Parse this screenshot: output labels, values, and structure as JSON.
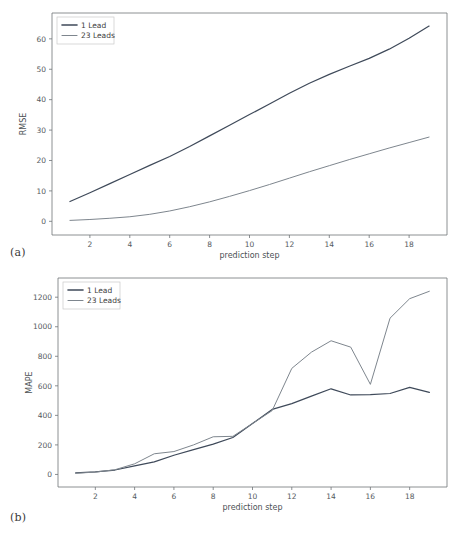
{
  "figure": {
    "panels": [
      {
        "id": "a",
        "caption": "(a)"
      },
      {
        "id": "b",
        "caption": "(b)"
      }
    ]
  },
  "colors": {
    "series_1_lead": "#3f4a5a",
    "series_23_leads": "#7e868e",
    "axis": "#6f7377",
    "text": "#4a4a4a",
    "background": "#ffffff",
    "legend_border": "#c9c9c9"
  },
  "chart_data": [
    {
      "type": "line",
      "panel": "a",
      "title": "",
      "xlabel": "prediction step",
      "ylabel": "RMSE",
      "xlim": [
        0.1,
        19.9
      ],
      "ylim": [
        -4.5,
        68.5
      ],
      "xticks": [
        2,
        4,
        6,
        8,
        10,
        12,
        14,
        16,
        18
      ],
      "yticks": [
        0,
        10,
        20,
        30,
        40,
        50,
        60
      ],
      "grid": false,
      "legend_position": "upper left",
      "x": [
        1,
        2,
        3,
        4,
        5,
        6,
        7,
        8,
        9,
        10,
        11,
        12,
        13,
        14,
        15,
        16,
        17,
        18,
        19
      ],
      "series": [
        {
          "name": "1 Lead",
          "color": "#3f4a5a",
          "values": [
            6.5,
            9.4,
            12.4,
            15.4,
            18.4,
            21.3,
            24.6,
            28.1,
            31.6,
            35.1,
            38.6,
            42.1,
            45.4,
            48.3,
            51.0,
            53.6,
            56.6,
            60.2,
            64.2
          ]
        },
        {
          "name": "23 Leads",
          "color": "#7e868e",
          "values": [
            0.3,
            0.6,
            1.0,
            1.5,
            2.3,
            3.4,
            4.8,
            6.4,
            8.2,
            10.1,
            12.1,
            14.2,
            16.3,
            18.3,
            20.3,
            22.2,
            24.1,
            25.9,
            27.7
          ]
        }
      ]
    },
    {
      "type": "line",
      "panel": "b",
      "title": "",
      "xlabel": "prediction step",
      "ylabel": "MAPE",
      "xlim": [
        0.1,
        19.9
      ],
      "ylim": [
        -85,
        1330
      ],
      "xticks": [
        2,
        4,
        6,
        8,
        10,
        12,
        14,
        16,
        18
      ],
      "yticks": [
        0,
        200,
        400,
        600,
        800,
        1000,
        1200
      ],
      "grid": false,
      "legend_position": "upper left",
      "x": [
        1,
        2,
        3,
        4,
        5,
        6,
        7,
        8,
        9,
        10,
        11,
        12,
        13,
        14,
        15,
        16,
        17,
        18,
        19
      ],
      "series": [
        {
          "name": "1 Lead",
          "color": "#3f4a5a",
          "values": [
            10,
            18,
            30,
            58,
            85,
            130,
            168,
            205,
            250,
            345,
            440,
            480,
            530,
            580,
            538,
            540,
            548,
            590,
            555
          ]
        },
        {
          "name": "23 Leads",
          "color": "#7e868e",
          "values": [
            8,
            16,
            32,
            72,
            140,
            155,
            200,
            255,
            258,
            345,
            432,
            718,
            828,
            905,
            862,
            610,
            1058,
            1190,
            1240
          ]
        }
      ]
    }
  ]
}
